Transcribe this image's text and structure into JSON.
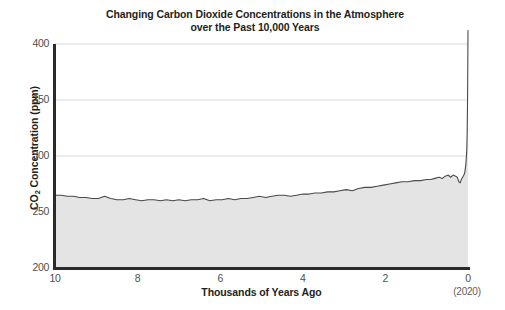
{
  "chart_data": {
    "type": "area",
    "title": "Changing Carbon Dioxide Concentrations in the Atmosphere\nover the Past 10,000 Years",
    "xlabel": "Thousands of Years Ago",
    "xlabel_note": "(2020)",
    "ylabel_prefix": "CO",
    "ylabel_sub": "2",
    "ylabel_suffix": " Concentration (ppm)",
    "ylabel": "CO2 Concentration (ppm)",
    "xlim": [
      10,
      0
    ],
    "ylim": [
      200,
      400
    ],
    "xticks": [
      10,
      8,
      6,
      4,
      2,
      0
    ],
    "xtick_labels": [
      "10",
      "8",
      "6",
      "4",
      "2",
      "0"
    ],
    "yticks": [
      200,
      250,
      300,
      350,
      400
    ],
    "ytick_labels": [
      "200",
      "250",
      "300",
      "350",
      "400"
    ],
    "grid": "horizontal",
    "legend": "none",
    "x_units": "thousands of years before present",
    "y_units": "ppm",
    "line_color": "#4a4a4a",
    "fill_color": "#e4e4e4",
    "axis_color": "#2b2b2b",
    "grid_color": "#d2d2d2",
    "x": [
      10.0,
      9.85,
      9.7,
      9.55,
      9.4,
      9.25,
      9.1,
      8.95,
      8.8,
      8.65,
      8.5,
      8.35,
      8.2,
      8.05,
      7.9,
      7.75,
      7.6,
      7.45,
      7.3,
      7.15,
      7.0,
      6.85,
      6.7,
      6.55,
      6.4,
      6.25,
      6.1,
      5.95,
      5.8,
      5.65,
      5.5,
      5.35,
      5.2,
      5.05,
      4.9,
      4.75,
      4.6,
      4.45,
      4.3,
      4.15,
      4.0,
      3.85,
      3.7,
      3.55,
      3.4,
      3.25,
      3.1,
      2.95,
      2.8,
      2.65,
      2.5,
      2.35,
      2.2,
      2.05,
      1.9,
      1.75,
      1.6,
      1.45,
      1.3,
      1.15,
      1.0,
      0.9,
      0.8,
      0.7,
      0.62,
      0.55,
      0.48,
      0.42,
      0.36,
      0.3,
      0.26,
      0.22,
      0.19,
      0.16,
      0.13,
      0.1,
      0.08,
      0.06,
      0.045,
      0.03,
      0.02,
      0.012,
      0.006,
      0.0
    ],
    "values": [
      265,
      265,
      264,
      264,
      263,
      263,
      262,
      262,
      264,
      262,
      261,
      261,
      262,
      261,
      260,
      261,
      261,
      260,
      261,
      260,
      261,
      260,
      261,
      261,
      262,
      260,
      261,
      261,
      262,
      261,
      262,
      262,
      263,
      264,
      263,
      264,
      265,
      265,
      264,
      265,
      266,
      266,
      267,
      267,
      268,
      268,
      269,
      270,
      269,
      271,
      272,
      272,
      273,
      274,
      275,
      276,
      277,
      277,
      278,
      278,
      279,
      279,
      280,
      281,
      280,
      282,
      283,
      281,
      283,
      282,
      281,
      277,
      276,
      279,
      281,
      283,
      285,
      290,
      296,
      305,
      320,
      345,
      375,
      412
    ],
    "annotations": [
      {
        "text": "Pre-industrial baseline ~265-280 ppm over 10,000 years"
      },
      {
        "text": "Sharp industrial-era rise to ~412 ppm at 2020"
      }
    ]
  }
}
